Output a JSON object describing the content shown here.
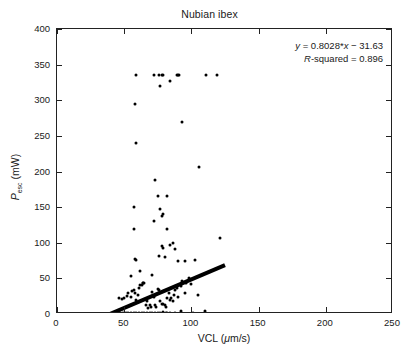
{
  "figure": {
    "title": "Nubian ibex",
    "background_color": "#ffffff",
    "marker_color": "#000000",
    "axis_color": "#222222"
  },
  "annotation": {
    "equation": "y = 0.8028*x − 31.63",
    "equation_prefix_italic": "y",
    "rsquared": "R-squared = 0.896",
    "rsquared_prefix_italic": "R"
  },
  "axes": {
    "x_label_text": "VCL (μm/s)",
    "x_label_main": "VCL (",
    "x_label_unit_italic": "μ",
    "x_label_tail": "m/s)",
    "y_label_main": "P",
    "y_label_sub": "esc",
    "y_label_tail": " (mW)",
    "x_ticks": [
      "0",
      "50",
      "100",
      "150",
      "200",
      "250"
    ],
    "y_ticks": [
      "0",
      "50",
      "100",
      "150",
      "200",
      "250",
      "300",
      "350",
      "400"
    ]
  },
  "chart_data": {
    "type": "scatter",
    "title": "Nubian ibex",
    "xlabel": "VCL (μm/s)",
    "ylabel": "P_esc (mW)",
    "xlim": [
      0,
      250
    ],
    "ylim": [
      0,
      400
    ],
    "xticks": [
      0,
      50,
      100,
      150,
      200,
      250
    ],
    "yticks": [
      0,
      50,
      100,
      150,
      200,
      250,
      300,
      350,
      400
    ],
    "grid": false,
    "legend": null,
    "annotations": [
      "y = 0.8028*x − 31.63",
      "R-squared = 0.896"
    ],
    "fit": {
      "type": "linear",
      "slope": 0.8028,
      "intercept": -31.63,
      "r_squared": 0.896,
      "x_start": 39.4,
      "x_end": 125.0,
      "line_width_px": 4
    },
    "series": [
      {
        "name": "Nubian ibex sperm",
        "marker": "point",
        "color": "#000000",
        "points": [
          [
            39.0,
            0.5
          ],
          [
            40.0,
            0.5
          ],
          [
            41.0,
            0.5
          ],
          [
            42.0,
            0.5
          ],
          [
            43.0,
            1.0
          ],
          [
            44.0,
            0.5
          ],
          [
            45.0,
            1.0
          ],
          [
            46.0,
            0.5
          ],
          [
            47.0,
            1.5
          ],
          [
            48.0,
            0.5
          ],
          [
            49.0,
            1.0
          ],
          [
            50.0,
            0.5
          ],
          [
            51.0,
            2.0
          ],
          [
            52.0,
            0.5
          ],
          [
            53.0,
            1.0
          ],
          [
            54.0,
            0.5
          ],
          [
            55.0,
            1.5
          ],
          [
            56.0,
            0.5
          ],
          [
            57.0,
            1.0
          ],
          [
            58.0,
            0.5
          ],
          [
            59.0,
            2.0
          ],
          [
            60.0,
            0.5
          ],
          [
            61.0,
            1.0
          ],
          [
            62.0,
            0.5
          ],
          [
            63.0,
            1.5
          ],
          [
            64.0,
            0.5
          ],
          [
            65.0,
            1.0
          ],
          [
            66.0,
            0.5
          ],
          [
            67.0,
            2.0
          ],
          [
            68.0,
            0.5
          ],
          [
            69.0,
            1.0
          ],
          [
            70.0,
            0.5
          ],
          [
            71.0,
            1.5
          ],
          [
            72.0,
            0.5
          ],
          [
            73.0,
            1.0
          ],
          [
            74.0,
            0.5
          ],
          [
            75.0,
            2.0
          ],
          [
            76.0,
            0.5
          ],
          [
            77.0,
            1.0
          ],
          [
            78.0,
            0.5
          ],
          [
            79.0,
            3.0
          ],
          [
            80.0,
            0.5
          ],
          [
            81.0,
            1.0
          ],
          [
            82.0,
            2.0
          ],
          [
            84.0,
            1.0
          ],
          [
            86.0,
            0.5
          ],
          [
            88.0,
            2.0
          ],
          [
            92.0,
            4.0
          ],
          [
            101.0,
            1.0
          ],
          [
            110.0,
            4.0
          ],
          [
            46.0,
            22.0
          ],
          [
            48.0,
            21.0
          ],
          [
            50.0,
            22.0
          ],
          [
            52.0,
            25.0
          ],
          [
            53.0,
            29.0
          ],
          [
            55.0,
            24.0
          ],
          [
            56.0,
            32.0
          ],
          [
            57.0,
            33.0
          ],
          [
            58.0,
            30.0
          ],
          [
            59.0,
            20.0
          ],
          [
            60.0,
            26.0
          ],
          [
            61.0,
            36.0
          ],
          [
            62.0,
            41.0
          ],
          [
            63.0,
            41.0
          ],
          [
            64.0,
            44.0
          ],
          [
            65.0,
            44.0
          ],
          [
            66.0,
            13.0
          ],
          [
            67.0,
            18.0
          ],
          [
            68.0,
            9.0
          ],
          [
            69.0,
            13.0
          ],
          [
            70.0,
            10.0
          ],
          [
            71.0,
            31.0
          ],
          [
            72.0,
            24.0
          ],
          [
            73.0,
            12.0
          ],
          [
            74.0,
            10.0
          ],
          [
            75.0,
            35.0
          ],
          [
            76.0,
            33.0
          ],
          [
            77.0,
            18.0
          ],
          [
            78.0,
            14.0
          ],
          [
            79.0,
            14.0
          ],
          [
            80.0,
            13.0
          ],
          [
            81.0,
            10.0
          ],
          [
            82.0,
            22.0
          ],
          [
            83.0,
            30.0
          ],
          [
            84.0,
            20.0
          ],
          [
            85.0,
            22.0
          ],
          [
            86.0,
            18.0
          ],
          [
            87.0,
            26.0
          ],
          [
            88.0,
            33.0
          ],
          [
            89.0,
            36.0
          ],
          [
            90.0,
            24.0
          ],
          [
            92.0,
            40.0
          ],
          [
            93.0,
            46.0
          ],
          [
            95.0,
            30.0
          ],
          [
            96.0,
            44.0
          ],
          [
            98.0,
            51.0
          ],
          [
            100.0,
            42.0
          ],
          [
            103.0,
            76.0
          ],
          [
            105.0,
            26.0
          ],
          [
            55.0,
            53.0
          ],
          [
            58.0,
            77.0
          ],
          [
            59.0,
            76.0
          ],
          [
            62.0,
            61.0
          ],
          [
            64.0,
            44.0
          ],
          [
            71.0,
            55.0
          ],
          [
            76.0,
            82.0
          ],
          [
            78.0,
            95.0
          ],
          [
            79.0,
            93.0
          ],
          [
            80.0,
            80.0
          ],
          [
            84.0,
            97.0
          ],
          [
            86.0,
            100.0
          ],
          [
            88.0,
            91.0
          ],
          [
            90.0,
            75.0
          ],
          [
            95.0,
            75.0
          ],
          [
            57.0,
            120.0
          ],
          [
            57.0,
            150.0
          ],
          [
            72.0,
            131.0
          ],
          [
            75.0,
            165.0
          ],
          [
            77.0,
            148.0
          ],
          [
            78.0,
            137.0
          ],
          [
            79.0,
            141.0
          ],
          [
            82.0,
            166.0
          ],
          [
            82.0,
            120.0
          ],
          [
            73.0,
            188.0
          ],
          [
            59.0,
            240.0
          ],
          [
            58.0,
            295.0
          ],
          [
            93.0,
            269.0
          ],
          [
            106.0,
            207.0
          ],
          [
            121.0,
            107.0
          ],
          [
            59.0,
            336.0
          ],
          [
            72.0,
            336.0
          ],
          [
            76.0,
            336.0
          ],
          [
            78.0,
            336.0
          ],
          [
            79.0,
            336.0
          ],
          [
            77.0,
            320.0
          ],
          [
            84.0,
            327.0
          ],
          [
            89.0,
            336.0
          ],
          [
            90.0,
            336.0
          ],
          [
            91.0,
            336.0
          ],
          [
            111.0,
            336.0
          ],
          [
            119.0,
            335.0
          ]
        ]
      }
    ]
  }
}
